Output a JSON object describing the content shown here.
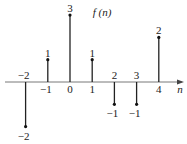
{
  "chart_data": {
    "type": "stem",
    "title": "f (n)",
    "xlabel": "n",
    "ylabel": "",
    "x": [
      -2,
      -1,
      0,
      1,
      2,
      3,
      4
    ],
    "values": [
      -2,
      1,
      3,
      1,
      -1,
      -1,
      2
    ],
    "ylim": [
      -2,
      3
    ],
    "grid": false,
    "legend": null
  }
}
